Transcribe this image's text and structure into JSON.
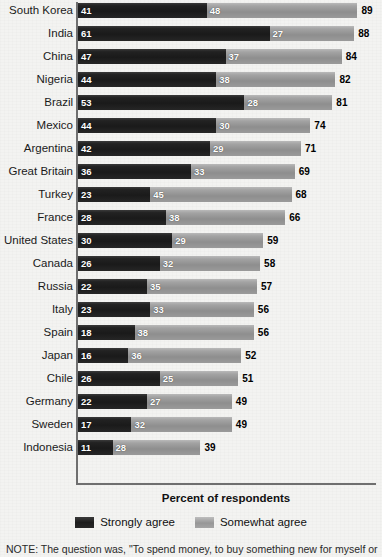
{
  "chart_data": {
    "type": "bar",
    "orientation": "horizontal",
    "stacked": true,
    "title": "",
    "xlabel": "Percent of respondents",
    "ylabel": "",
    "xlim": [
      0,
      100
    ],
    "grid": false,
    "legend_position": "bottom",
    "categories": [
      "South Korea",
      "India",
      "China",
      "Nigeria",
      "Brazil",
      "Mexico",
      "Argentina",
      "Great Britain",
      "Turkey",
      "France",
      "United States",
      "Canada",
      "Russia",
      "Italy",
      "Spain",
      "Japan",
      "Chile",
      "Germany",
      "Sweden",
      "Indonesia"
    ],
    "series": [
      {
        "name": "Strongly agree",
        "color": "#1d1d1d",
        "values": [
          41,
          61,
          47,
          44,
          53,
          44,
          42,
          36,
          23,
          28,
          30,
          26,
          22,
          23,
          18,
          16,
          26,
          22,
          17,
          11
        ]
      },
      {
        "name": "Somewhat agree",
        "color": "#979797",
        "values": [
          48,
          27,
          37,
          38,
          28,
          30,
          29,
          33,
          45,
          38,
          29,
          32,
          35,
          33,
          38,
          36,
          25,
          27,
          32,
          28
        ]
      }
    ],
    "totals": [
      89,
      88,
      84,
      82,
      81,
      74,
      71,
      69,
      68,
      66,
      59,
      58,
      57,
      56,
      56,
      52,
      51,
      49,
      49,
      39
    ]
  },
  "legend": {
    "items": [
      {
        "label": "Strongly agree",
        "swatch": "dark"
      },
      {
        "label": "Somewhat agree",
        "swatch": "light"
      }
    ]
  },
  "axis": {
    "xlabel": "Percent of respondents"
  },
  "note": {
    "text": "NOTE: The question was, \"To spend money, to buy something new for myself or"
  }
}
